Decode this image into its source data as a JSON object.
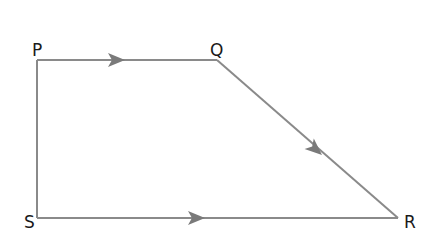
{
  "diagram": {
    "type": "trapezium",
    "stroke_color": "#8a8a8a",
    "arrow_color": "#7a7a7a",
    "label_color": "#1a1a1a",
    "vertices": [
      {
        "id": "P",
        "label": "P",
        "x": 37,
        "y": 60
      },
      {
        "id": "Q",
        "label": "Q",
        "x": 217,
        "y": 60
      },
      {
        "id": "R",
        "label": "R",
        "x": 398,
        "y": 218
      },
      {
        "id": "S",
        "label": "S",
        "x": 37,
        "y": 218
      }
    ],
    "edges": [
      {
        "from": "P",
        "to": "Q",
        "arrow": true,
        "direction": "P→Q"
      },
      {
        "from": "Q",
        "to": "R",
        "arrow": true,
        "direction": "Q→R"
      },
      {
        "from": "S",
        "to": "R",
        "arrow": true,
        "direction": "S→R"
      },
      {
        "from": "P",
        "to": "S",
        "arrow": false
      }
    ]
  }
}
